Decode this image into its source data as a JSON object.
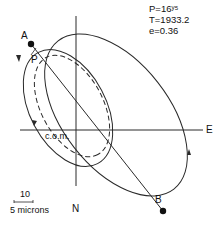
{
  "diagram": {
    "type": "binary-orbit",
    "parameters": {
      "period": "P=16ʸ⁵",
      "periastron_time": "T=1933.2",
      "eccentricity": "e=0.36"
    },
    "labels": {
      "point_a": "A",
      "point_b": "B",
      "periastron": "P",
      "center_of_mass": "c.o.m.",
      "east": "E",
      "north": "N"
    },
    "scale_bar": {
      "value": "10",
      "units": "5 microns"
    },
    "colors": {
      "line": "#2a2a2a",
      "background": "#ffffff"
    }
  }
}
